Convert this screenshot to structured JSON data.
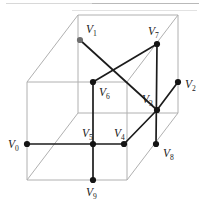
{
  "figure": {
    "canvas": {
      "width": 205,
      "height": 208
    },
    "colors": {
      "background": "#ffffff",
      "wireframe": "#b0b0b0",
      "solid_edge": "#1c1c1c",
      "node": "#141414",
      "node_gray": "#6e6e6e",
      "label": "#1a1a1a"
    },
    "cube": {
      "front_face": [
        [
          27,
          82
        ],
        [
          127,
          82
        ],
        [
          127,
          180
        ],
        [
          27,
          180
        ]
      ],
      "back_face": [
        [
          78,
          15
        ],
        [
          178,
          15
        ],
        [
          178,
          113
        ],
        [
          78,
          113
        ]
      ],
      "depth_offset": [
        51,
        -67
      ]
    },
    "vertices": [
      {
        "id": "V0",
        "name": "V",
        "sub": "0",
        "x": 27,
        "y": 144,
        "label_x": 8,
        "label_y": 148,
        "dot": "dark"
      },
      {
        "id": "V1",
        "name": "V",
        "sub": "1",
        "x": 80,
        "y": 40,
        "label_x": 86,
        "label_y": 33,
        "dot": "gray"
      },
      {
        "id": "V2",
        "name": "V",
        "sub": "2",
        "x": 178,
        "y": 82,
        "label_x": 185,
        "label_y": 88,
        "dot": "dark"
      },
      {
        "id": "V3",
        "name": "V",
        "sub": "3",
        "x": 157,
        "y": 110,
        "label_x": 142,
        "label_y": 103,
        "dot": "dark"
      },
      {
        "id": "V4",
        "name": "V",
        "sub": "4",
        "x": 124,
        "y": 144,
        "label_x": 114,
        "label_y": 137,
        "dot": "dark"
      },
      {
        "id": "V5",
        "name": "V",
        "sub": "5",
        "x": 93,
        "y": 144,
        "label_x": 82,
        "label_y": 137,
        "dot": "dark"
      },
      {
        "id": "V6",
        "name": "V",
        "sub": "6",
        "x": 93,
        "y": 82,
        "label_x": 99,
        "label_y": 96,
        "dot": "dark"
      },
      {
        "id": "V7",
        "name": "V",
        "sub": "7",
        "x": 157,
        "y": 44,
        "label_x": 148,
        "label_y": 35,
        "dot": "dark"
      },
      {
        "id": "V8",
        "name": "V",
        "sub": "8",
        "x": 156,
        "y": 144,
        "label_x": 163,
        "label_y": 157,
        "dot": "dark"
      },
      {
        "id": "V9",
        "name": "V",
        "sub": "9",
        "x": 93,
        "y": 180,
        "label_x": 86,
        "label_y": 196,
        "dot": "dark"
      }
    ],
    "solid_edges": [
      {
        "from": "V0",
        "to": "V5"
      },
      {
        "from": "V5",
        "to": "V4"
      },
      {
        "from": "V5",
        "to": "V6"
      },
      {
        "from": "V5",
        "to": "V9"
      },
      {
        "from": "V6",
        "to": "V7"
      },
      {
        "from": "V7",
        "to": "V8"
      },
      {
        "from": "V1",
        "to": "V3"
      },
      {
        "from": "V4",
        "to": "V3"
      },
      {
        "from": "V3",
        "to": "V2"
      }
    ],
    "wire_edges": [
      {
        "from": [
          27,
          82
        ],
        "to": [
          127,
          82
        ]
      },
      {
        "from": [
          127,
          82
        ],
        "to": [
          127,
          180
        ]
      },
      {
        "from": [
          127,
          180
        ],
        "to": [
          27,
          180
        ]
      },
      {
        "from": [
          27,
          180
        ],
        "to": [
          27,
          82
        ]
      },
      {
        "from": [
          78,
          15
        ],
        "to": [
          178,
          15
        ]
      },
      {
        "from": [
          178,
          15
        ],
        "to": [
          178,
          113
        ]
      },
      {
        "from": [
          178,
          113
        ],
        "to": [
          78,
          113
        ]
      },
      {
        "from": [
          78,
          113
        ],
        "to": [
          78,
          15
        ]
      },
      {
        "from": [
          27,
          82
        ],
        "to": [
          78,
          15
        ]
      },
      {
        "from": [
          127,
          82
        ],
        "to": [
          178,
          15
        ]
      },
      {
        "from": [
          127,
          180
        ],
        "to": [
          178,
          113
        ]
      },
      {
        "from": [
          27,
          180
        ],
        "to": [
          78,
          113
        ]
      }
    ]
  }
}
